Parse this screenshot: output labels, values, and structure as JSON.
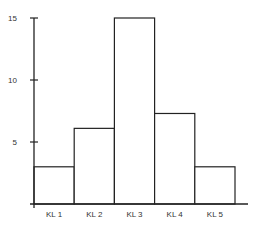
{
  "chart_data": {
    "type": "bar",
    "title": "",
    "xlabel": "",
    "ylabel": "",
    "categories": [
      "KL 1",
      "KL 2",
      "KL 3",
      "KL 4",
      "KL 5"
    ],
    "values": [
      3,
      6.1,
      15,
      7.3,
      3
    ],
    "yticks": [
      5,
      10,
      15
    ],
    "ylim": [
      0,
      15
    ],
    "grid": false,
    "legend": null
  }
}
